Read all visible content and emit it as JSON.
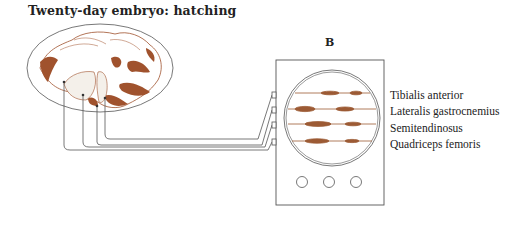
{
  "figure": {
    "title": "Twenty-day embryo: hatching",
    "panel_label": "B",
    "muscles": [
      {
        "label": "Tibialis anterior",
        "y": 89
      },
      {
        "label": "Lateralis gastrocnemius",
        "y": 105
      },
      {
        "label": "Semitendinosus",
        "y": 122
      },
      {
        "label": "Quadriceps femoris",
        "y": 138
      }
    ],
    "colors": {
      "line": "#555555",
      "tissue": "#a0522d",
      "trace": "#9c5a34"
    },
    "oscilloscope": {
      "knob_count": 3
    }
  }
}
